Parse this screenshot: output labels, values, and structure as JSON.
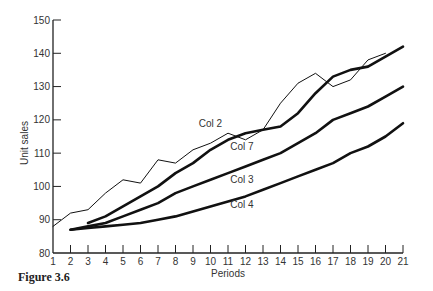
{
  "chart_data": {
    "type": "line",
    "title": "",
    "caption": "Figure 3.6",
    "xlabel": "Periods",
    "ylabel": "Unit sales",
    "xlim": [
      1,
      21
    ],
    "ylim": [
      80,
      150
    ],
    "x_ticks": [
      1,
      2,
      3,
      4,
      5,
      6,
      7,
      8,
      9,
      10,
      11,
      12,
      13,
      14,
      15,
      16,
      17,
      18,
      19,
      20,
      21
    ],
    "y_ticks": [
      80,
      90,
      100,
      110,
      120,
      130,
      140,
      150
    ],
    "grid": false,
    "legend": "inline labels",
    "series": [
      {
        "name": "Col 2",
        "style": "thin",
        "x": [
          1,
          2,
          3,
          4,
          5,
          6,
          7,
          8,
          9,
          10,
          11,
          12,
          13,
          14,
          15,
          16,
          17,
          18,
          19,
          20
        ],
        "values": [
          88,
          92,
          93,
          98,
          102,
          101,
          108,
          107,
          111,
          113,
          116,
          114,
          117,
          125,
          131,
          134,
          130,
          132,
          138,
          140
        ],
        "label_pos": [
          10,
          118
        ]
      },
      {
        "name": "Col 7",
        "style": "thick",
        "x": [
          3,
          4,
          5,
          6,
          7,
          8,
          9,
          10,
          11,
          12,
          13,
          14,
          15,
          16,
          17,
          18,
          19,
          20,
          21
        ],
        "values": [
          89,
          91,
          94,
          97,
          100,
          104,
          107,
          111,
          114,
          116,
          117,
          118,
          122,
          128,
          133,
          135,
          136,
          139,
          142
        ],
        "label_pos": [
          11.8,
          111
        ]
      },
      {
        "name": "Col 3",
        "style": "thick",
        "x": [
          2,
          3,
          4,
          5,
          6,
          7,
          8,
          9,
          10,
          11,
          12,
          13,
          14,
          15,
          16,
          17,
          18,
          19,
          20,
          21
        ],
        "values": [
          87,
          88,
          89,
          91,
          93,
          95,
          98,
          100,
          102,
          104,
          106,
          108,
          110,
          113,
          116,
          120,
          122,
          124,
          127,
          130
        ],
        "label_pos": [
          11.8,
          101
        ]
      },
      {
        "name": "Col 4",
        "style": "thick",
        "x": [
          2,
          3,
          4,
          5,
          6,
          7,
          8,
          9,
          10,
          11,
          12,
          13,
          14,
          15,
          16,
          17,
          18,
          19,
          20,
          21
        ],
        "values": [
          87,
          87.5,
          88,
          88.5,
          89,
          90,
          91,
          92.5,
          94,
          95.5,
          97,
          99,
          101,
          103,
          105,
          107,
          110,
          112,
          115,
          119
        ],
        "label_pos": [
          11.8,
          93.5
        ]
      }
    ]
  }
}
